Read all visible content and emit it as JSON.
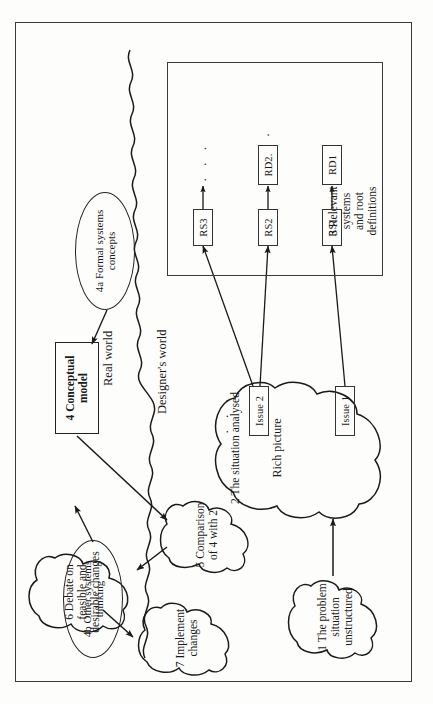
{
  "figure": {
    "orientation": "rotated-90-ccw",
    "frame_color": "#3a3a3a",
    "ink_color": "#1a1a1a",
    "paper_color": "#fdfdfc"
  },
  "divider": {
    "label_above": "Real world",
    "label_below": "Designer's world",
    "style": "wavy-line"
  },
  "stages": {
    "s1": {
      "label": "1 The problem\nsituation\nunstructured",
      "shape": "cloud"
    },
    "s2": {
      "label": "2 The situation analysed",
      "sublabel": "Rich picture",
      "shape": "cloud"
    },
    "s3": {
      "label": "3 Relevant\nsystems\nand root\ndefinitions",
      "shape": "box"
    },
    "s4": {
      "label": "4 Conceptual\nmodel",
      "shape": "rectangle"
    },
    "s4a": {
      "label": "4a Formal systems\nconcepts",
      "shape": "ellipse"
    },
    "s4b": {
      "label": "4b Other systems\nthinking",
      "shape": "ellipse"
    },
    "s5": {
      "label": "5 Comparison\nof 4 with 2",
      "shape": "cloud"
    },
    "s6": {
      "label": "6 Debate on\nfeasible and\ndesirable changes",
      "shape": "cloud"
    },
    "s7": {
      "label": "7 Implement\nchanges",
      "shape": "cloud"
    }
  },
  "issues": [
    {
      "id": "issue1",
      "label": "Issue 1"
    },
    {
      "id": "issue2",
      "label": "Issue 2"
    }
  ],
  "issue_ellipsis": "· · ·",
  "relevant_systems": [
    {
      "rs": "RS1",
      "rd": "RD1"
    },
    {
      "rs": "RS2",
      "rd": "RD2."
    },
    {
      "rs": "RS3",
      "rd": "· · ·"
    }
  ],
  "rd_ellipsis": "·",
  "arrows": [
    {
      "from": "1 The problem situation unstructured",
      "to": "2 The situation analysed"
    },
    {
      "from": "Issue 1",
      "to": "RS1"
    },
    {
      "from": "Issue 2",
      "to": "RS2"
    },
    {
      "from": "Issue 2",
      "to": "RS3"
    },
    {
      "from": "RS1",
      "to": "RD1"
    },
    {
      "from": "RS2",
      "to": "RD2."
    },
    {
      "from": "RS3",
      "to": "· · ·"
    },
    {
      "from": "4a Formal systems concepts",
      "to": "4 Conceptual model"
    },
    {
      "from": "4b Other systems thinking",
      "to": "4 Conceptual model"
    },
    {
      "from": "4 Conceptual model",
      "to": "5 Comparison of 4 with 2"
    },
    {
      "from": "5 Comparison of 4 with 2",
      "to": "6 Debate on feasible and desirable changes"
    },
    {
      "from": "6 Debate on feasible and desirable changes",
      "to": "7 Implement changes"
    }
  ]
}
